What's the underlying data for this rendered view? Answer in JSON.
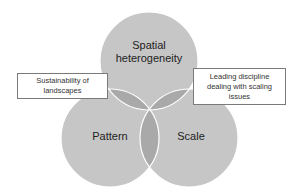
{
  "diagram": {
    "type": "venn",
    "circles": [
      {
        "id": "top",
        "label": "Spatial heterogeneity",
        "label_lines": [
          "Spatial",
          "heterogeneity"
        ]
      },
      {
        "id": "left",
        "label": "Pattern"
      },
      {
        "id": "right",
        "label": "Scale"
      }
    ],
    "callouts": [
      {
        "id": "left",
        "text": "Sustainability of landscapes",
        "points_to": "top-left overlap"
      },
      {
        "id": "right",
        "text": "Leading discipline dealing with scaling issues",
        "points_to": "top-right overlap"
      }
    ],
    "colors": {
      "circle_fill": "#c6c6c6",
      "pair_overlap": "#a9a9a9",
      "triple_overlap": "#999999",
      "circle_stroke": "#ffffff"
    }
  }
}
